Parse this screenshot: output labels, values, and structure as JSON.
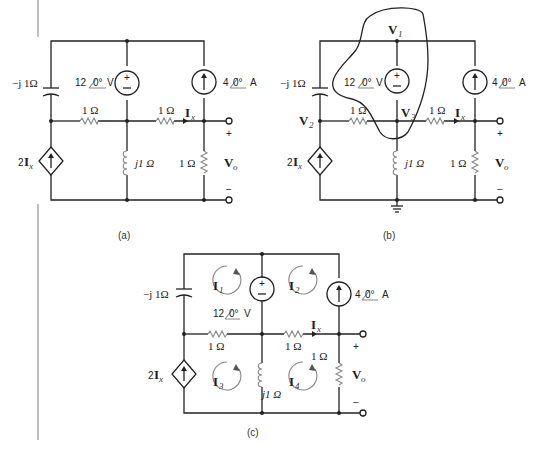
{
  "figure": {
    "panels": [
      {
        "caption": "(a)",
        "labels": {
          "capacitor": "−j 1Ω",
          "voltage_source": "12",
          "voltage_angle": "0°",
          "voltage_unit": "V",
          "current_source": "4",
          "current_angle": "0°",
          "current_unit": "A",
          "r_left": "1 Ω",
          "r_mid": "1 Ω",
          "ix": "I",
          "ix_sub": "x",
          "dep_source_coef": "2",
          "dep_source_var": "I",
          "dep_source_sub": "x",
          "inductor": "j1 Ω",
          "r_out": "1 Ω",
          "vo": "V",
          "vo_sub": "o",
          "plus": "+",
          "minus": "−"
        }
      },
      {
        "caption": "(b)",
        "labels": {
          "capacitor": "−j 1Ω",
          "voltage_source": "12",
          "voltage_angle": "0°",
          "voltage_unit": "V",
          "current_source": "4",
          "current_angle": "0°",
          "current_unit": "A",
          "r_left": "1 Ω",
          "r_mid": "1 Ω",
          "ix": "I",
          "ix_sub": "x",
          "dep_source_coef": "2",
          "dep_source_var": "I",
          "dep_source_sub": "x",
          "inductor": "j1 Ω",
          "r_out": "1 Ω",
          "vo": "V",
          "vo_sub": "o",
          "plus": "+",
          "minus": "−",
          "v1": "V",
          "v1_sub": "1",
          "v2": "V",
          "v2_sub": "2",
          "v3": "V",
          "v3_sub": "3"
        }
      },
      {
        "caption": "(c)",
        "labels": {
          "capacitor": "−j 1Ω",
          "voltage_source": "12",
          "voltage_angle": "0°",
          "voltage_unit": "V",
          "current_source": "4",
          "current_angle": "0°",
          "current_unit": "A",
          "r_left": "1 Ω",
          "r_mid": "1 Ω",
          "ix": "I",
          "ix_sub": "x",
          "dep_source_coef": "2",
          "dep_source_var": "I",
          "dep_source_sub": "x",
          "inductor": "j1 Ω",
          "r_out": "1 Ω",
          "vo": "V",
          "vo_sub": "o",
          "plus": "+",
          "minus": "−",
          "loops": [
            {
              "label": "I",
              "sub": "1"
            },
            {
              "label": "I",
              "sub": "2"
            },
            {
              "label": "I",
              "sub": "3"
            },
            {
              "label": "I",
              "sub": "4"
            }
          ]
        }
      }
    ]
  }
}
